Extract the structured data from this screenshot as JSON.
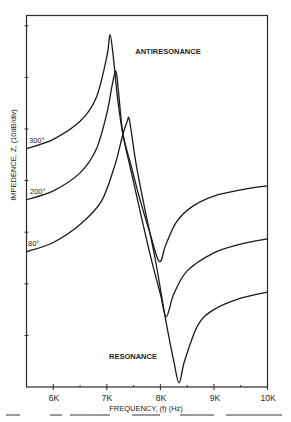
{
  "chart_data": {
    "type": "line",
    "title": "",
    "xlabel": "FREQUENCY, (f) (Hz)",
    "ylabel": "IMPEDENCE, Z, (10dB/div)",
    "x_unit": "kHz",
    "xlim": [
      5.5,
      10
    ],
    "x_ticks": [
      6,
      7,
      8,
      9,
      10
    ],
    "x_tick_labels": [
      "6K",
      "7K",
      "8K",
      "9K",
      "10K"
    ],
    "y_unit": "divisions (10 dB/div)",
    "ylim": [
      0,
      7.2
    ],
    "y_ticks": [
      1,
      2,
      3,
      4,
      5,
      6,
      7
    ],
    "grid": false,
    "legend": "inline labels at left",
    "annotations": [
      {
        "text": "ANTIRESONANCE",
        "x": 7.85,
        "y": 6.5
      },
      {
        "text": "RESONANCE",
        "x": 7.6,
        "y": 0.6
      }
    ],
    "series": [
      {
        "name": "300°",
        "x": [
          5.5,
          6.0,
          6.5,
          6.8,
          7.0,
          7.06,
          7.12,
          7.2,
          7.3,
          7.45,
          7.6,
          7.8,
          7.98,
          8.1,
          8.3,
          8.6,
          9.0,
          9.5,
          10.0
        ],
        "y": [
          4.62,
          4.8,
          5.15,
          5.6,
          6.4,
          6.83,
          6.4,
          5.6,
          4.9,
          4.3,
          3.7,
          3.0,
          2.43,
          2.75,
          3.2,
          3.5,
          3.7,
          3.82,
          3.9
        ]
      },
      {
        "name": "200°",
        "x": [
          5.5,
          6.0,
          6.5,
          6.8,
          7.0,
          7.1,
          7.17,
          7.22,
          7.3,
          7.45,
          7.6,
          7.8,
          8.0,
          8.11,
          8.25,
          8.5,
          9.0,
          9.5,
          10.0
        ],
        "y": [
          3.63,
          3.8,
          4.15,
          4.6,
          5.3,
          5.85,
          6.12,
          5.7,
          4.9,
          4.2,
          3.5,
          2.6,
          1.8,
          1.36,
          1.8,
          2.25,
          2.6,
          2.77,
          2.87
        ]
      },
      {
        "name": "80°",
        "x": [
          5.5,
          6.0,
          6.5,
          6.9,
          7.15,
          7.3,
          7.38,
          7.41,
          7.45,
          7.55,
          7.7,
          7.9,
          8.1,
          8.25,
          8.35,
          8.45,
          8.7,
          9.0,
          9.5,
          10.0
        ],
        "y": [
          2.62,
          2.8,
          3.15,
          3.6,
          4.3,
          4.9,
          5.15,
          5.22,
          5.0,
          4.3,
          3.5,
          2.5,
          1.3,
          0.5,
          0.08,
          0.5,
          1.2,
          1.5,
          1.72,
          1.84
        ]
      }
    ]
  },
  "labels": {
    "y_axis": "IMPEDENCE, Z, (10dB/div)",
    "x_axis": "FREQUENCY, (f) (Hz)",
    "antiresonance": "ANTIRESONANCE",
    "resonance": "RESONANCE",
    "series_300": "300°",
    "series_200": "200°",
    "series_80": "80°",
    "tick_6k": "6K",
    "tick_7k": "7K",
    "tick_8k": "8K",
    "tick_9k": "9K",
    "tick_10k": "10K"
  }
}
